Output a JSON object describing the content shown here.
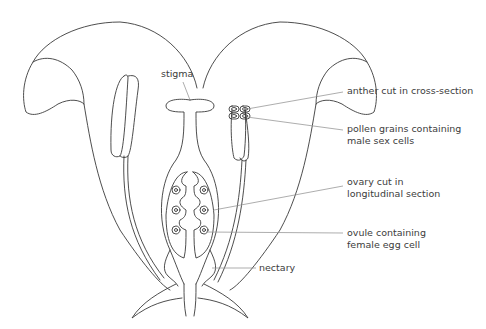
{
  "figure": {
    "background": "#ffffff",
    "line_color": "#3a3a3a",
    "leader_color": "#8a8a8a"
  },
  "labels": {
    "stigma": "stigma",
    "anther_line1": "anther cut in cross-section",
    "pollen_line1": "pollen grains containing",
    "pollen_line2": "male sex cells",
    "ovary_line1": "ovary cut in",
    "ovary_line2": "longitudinal section",
    "ovule_line1": "ovule containing",
    "ovule_line2": "female egg cell",
    "nectary": "nectary"
  }
}
